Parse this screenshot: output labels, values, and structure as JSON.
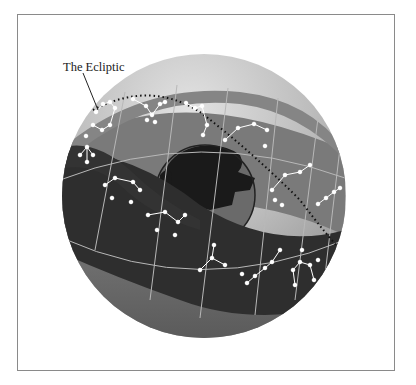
{
  "figure": {
    "title_label": "The Ecliptic",
    "elements": {
      "celestial_sphere": "celestial-sphere",
      "zodiac_band": "zodiac-band",
      "earth": "earth-globe",
      "ecliptic_line": "ecliptic-dotted-line",
      "constellations": "constellation-star-patterns"
    },
    "colors": {
      "frame_border": "#8a8a8a",
      "sphere_light": "#c9c9c9",
      "sphere_dark": "#6f6f6f",
      "band_back": "#7a7a7a",
      "band_front": "#2e2e2e",
      "band_lower": "#5e5e5e",
      "grid_lines": "#b8b8b8",
      "stars": "#ffffff",
      "earth_land": "#1a1a1a",
      "earth_sea": "#6a6a6a"
    }
  }
}
